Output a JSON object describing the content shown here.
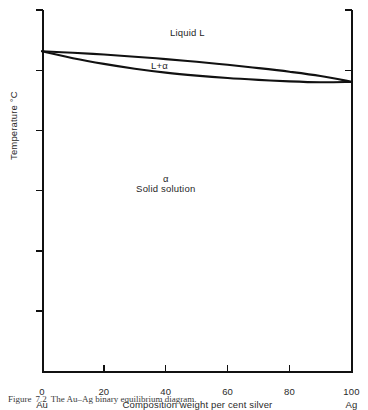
{
  "figure": {
    "caption_label": "Figure",
    "caption_number": "7.2",
    "caption_text": "The Au–Ag binary equilibrium diagram."
  },
  "chart_data": {
    "type": "line",
    "title": "",
    "xlabel": "Composition weight per cent silver",
    "ylabel": "Temperature °C",
    "xlim": [
      0,
      100
    ],
    "ylim": [
      0,
      1200
    ],
    "grid": false,
    "legend": "none",
    "x_ticks": [
      "0",
      "20",
      "40",
      "60",
      "80",
      "100"
    ],
    "x_tick_values": [
      0,
      20,
      40,
      60,
      80,
      100
    ],
    "y_ticks": [
      "0",
      "200",
      "400",
      "600",
      "800",
      "1000",
      "1200"
    ],
    "y_tick_values": [
      0,
      200,
      400,
      600,
      800,
      1000,
      1200
    ],
    "endpoint_left": "Au",
    "endpoint_right": "Ag",
    "series": [
      {
        "name": "liquidus",
        "x": [
          0,
          10,
          20,
          30,
          40,
          50,
          60,
          70,
          80,
          90,
          100
        ],
        "values": [
          1063,
          1058,
          1052,
          1045,
          1037,
          1028,
          1018,
          1007,
          995,
          981,
          962
        ]
      },
      {
        "name": "solidus",
        "x": [
          0,
          10,
          20,
          30,
          40,
          50,
          60,
          70,
          80,
          90,
          100
        ],
        "values": [
          1063,
          1040,
          1021,
          1005,
          992,
          982,
          974,
          968,
          963,
          960,
          961
        ]
      }
    ],
    "annotations": [
      {
        "name": "liquid-region",
        "text": "Liquid L",
        "x": 47,
        "y": 1125
      },
      {
        "name": "two-phase-region",
        "text": "L+α",
        "x": 38,
        "y": 1015
      },
      {
        "name": "solid-solution-alpha",
        "text": "α",
        "x": 40,
        "y": 640
      },
      {
        "name": "solid-solution-name",
        "text": "Solid solution",
        "x": 40,
        "y": 605
      }
    ]
  }
}
